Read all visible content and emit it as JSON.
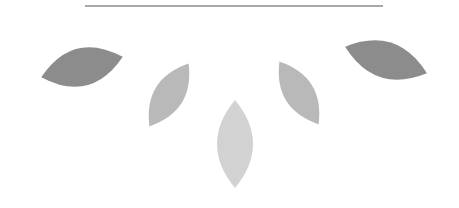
{
  "graphic": {
    "rule": {
      "color": "#a8a8a8"
    },
    "leaves": [
      {
        "name": "leaf-far-left",
        "cx": 82,
        "cy": 67,
        "len": 84,
        "wid": 38,
        "angle": -14,
        "color": "#8c8c8c"
      },
      {
        "name": "leaf-mid-left",
        "cx": 169,
        "cy": 95,
        "len": 74,
        "wid": 30,
        "angle": -58,
        "color": "#b9b9b9"
      },
      {
        "name": "leaf-center",
        "cx": 235,
        "cy": 144,
        "len": 88,
        "wid": 36,
        "angle": -90,
        "color": "#d2d2d2"
      },
      {
        "name": "leaf-mid-right",
        "cx": 299,
        "cy": 93,
        "len": 74,
        "wid": 30,
        "angle": -122,
        "color": "#b9b9b9"
      },
      {
        "name": "leaf-far-right",
        "cx": 386,
        "cy": 60,
        "len": 86,
        "wid": 36,
        "angle": 18,
        "color": "#8c8c8c"
      }
    ]
  }
}
